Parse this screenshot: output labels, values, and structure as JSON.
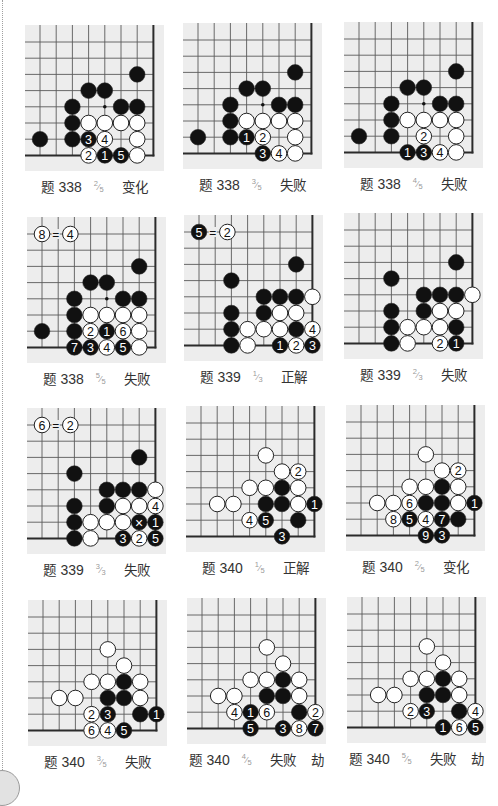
{
  "style": {
    "board_bg": "#ededed",
    "grid_line": "#5a5a5a",
    "edge_line": "#2b2b2b",
    "black_stone": "#111111",
    "white_stone": "#ffffff",
    "stone_outline": "#222222",
    "caption_text": "#333333",
    "fraction_text": "#9a9a9a"
  },
  "fraction_slash": "⁄",
  "diagrams": [
    {
      "problem_label": "题",
      "problem_number": "338",
      "fraction": {
        "num": "2",
        "den": "5"
      },
      "result": "变化",
      "extra": "",
      "star_points": [
        [
          4,
          4
        ]
      ],
      "note": null,
      "stones": [
        [
          "b",
          6,
          2
        ],
        [
          "b",
          3,
          3
        ],
        [
          "b",
          4,
          3
        ],
        [
          "b",
          2,
          4
        ],
        [
          "b",
          5,
          4
        ],
        [
          "b",
          6,
          4
        ],
        [
          "b",
          2,
          5
        ],
        [
          "w",
          3,
          5
        ],
        [
          "w",
          4,
          5
        ],
        [
          "w",
          5,
          5
        ],
        [
          "w",
          6,
          5
        ],
        [
          "b",
          0,
          6
        ],
        [
          "b",
          2,
          6
        ],
        [
          "b",
          3,
          6,
          "3"
        ],
        [
          "w",
          4,
          6,
          "4"
        ],
        [
          "w",
          6,
          6
        ],
        [
          "w",
          3,
          7,
          "2"
        ],
        [
          "b",
          4,
          7,
          "1"
        ],
        [
          "b",
          5,
          7,
          "5"
        ],
        [
          "w",
          6,
          7
        ]
      ]
    },
    {
      "problem_label": "题",
      "problem_number": "338",
      "fraction": {
        "num": "3",
        "den": "5"
      },
      "result": "失败",
      "extra": "",
      "star_points": [
        [
          4,
          4
        ]
      ],
      "note": null,
      "stones": [
        [
          "b",
          6,
          2
        ],
        [
          "b",
          3,
          3
        ],
        [
          "b",
          4,
          3
        ],
        [
          "b",
          2,
          4
        ],
        [
          "b",
          5,
          4
        ],
        [
          "b",
          6,
          4
        ],
        [
          "b",
          2,
          5
        ],
        [
          "w",
          3,
          5
        ],
        [
          "w",
          4,
          5
        ],
        [
          "w",
          5,
          5
        ],
        [
          "w",
          6,
          5
        ],
        [
          "b",
          0,
          6
        ],
        [
          "b",
          2,
          6
        ],
        [
          "b",
          3,
          6,
          "1"
        ],
        [
          "w",
          4,
          6,
          "2"
        ],
        [
          "w",
          6,
          6
        ],
        [
          "b",
          4,
          7,
          "3"
        ],
        [
          "w",
          5,
          7,
          "4"
        ],
        [
          "w",
          6,
          7
        ]
      ]
    },
    {
      "problem_label": "题",
      "problem_number": "338",
      "fraction": {
        "num": "4",
        "den": "5"
      },
      "result": "失败",
      "extra": "",
      "star_points": [
        [
          4,
          4
        ]
      ],
      "note": null,
      "stones": [
        [
          "b",
          6,
          2
        ],
        [
          "b",
          3,
          3
        ],
        [
          "b",
          4,
          3
        ],
        [
          "b",
          2,
          4
        ],
        [
          "b",
          5,
          4
        ],
        [
          "b",
          6,
          4
        ],
        [
          "b",
          2,
          5
        ],
        [
          "w",
          3,
          5
        ],
        [
          "w",
          4,
          5
        ],
        [
          "w",
          5,
          5
        ],
        [
          "w",
          6,
          5
        ],
        [
          "b",
          0,
          6
        ],
        [
          "b",
          2,
          6
        ],
        [
          "w",
          4,
          6,
          "2"
        ],
        [
          "w",
          6,
          6
        ],
        [
          "b",
          3,
          7,
          "1"
        ],
        [
          "b",
          4,
          7,
          "3"
        ],
        [
          "w",
          5,
          7,
          "4"
        ],
        [
          "w",
          6,
          7
        ]
      ]
    },
    {
      "problem_label": "题",
      "problem_number": "338",
      "fraction": {
        "num": "5",
        "den": "5"
      },
      "result": "失败",
      "extra": "",
      "star_points": [
        [
          4,
          4
        ]
      ],
      "note": {
        "row": 0,
        "left": {
          "color": "w",
          "label": "8",
          "col": 0
        },
        "equals": "=",
        "equals_col": 0.85,
        "right": {
          "color": "w",
          "label": "4",
          "col": 1.75
        }
      },
      "stones": [
        [
          "b",
          6,
          2
        ],
        [
          "b",
          3,
          3
        ],
        [
          "b",
          4,
          3
        ],
        [
          "b",
          2,
          4
        ],
        [
          "b",
          5,
          4
        ],
        [
          "b",
          6,
          4
        ],
        [
          "b",
          2,
          5
        ],
        [
          "w",
          3,
          5
        ],
        [
          "w",
          4,
          5
        ],
        [
          "w",
          5,
          5
        ],
        [
          "w",
          6,
          5
        ],
        [
          "b",
          0,
          6
        ],
        [
          "b",
          2,
          6
        ],
        [
          "w",
          3,
          6,
          "2"
        ],
        [
          "b",
          4,
          6,
          "1"
        ],
        [
          "w",
          5,
          6,
          "6"
        ],
        [
          "w",
          6,
          6
        ],
        [
          "b",
          2,
          7,
          "7"
        ],
        [
          "b",
          3,
          7,
          "3"
        ],
        [
          "w",
          4,
          7,
          "4"
        ],
        [
          "b",
          5,
          7,
          "5"
        ],
        [
          "w",
          6,
          7
        ]
      ]
    },
    {
      "problem_label": "题",
      "problem_number": "339",
      "fraction": {
        "num": "1",
        "den": "3"
      },
      "result": "正解",
      "extra": "",
      "star_points": [],
      "note": {
        "row": 0,
        "left": {
          "color": "b",
          "label": "5",
          "col": 0
        },
        "equals": "=",
        "equals_col": 0.85,
        "right": {
          "color": "w",
          "label": "2",
          "col": 1.75
        }
      },
      "stones": [
        [
          "b",
          6,
          2
        ],
        [
          "b",
          2,
          3
        ],
        [
          "b",
          4,
          4
        ],
        [
          "b",
          5,
          4
        ],
        [
          "b",
          6,
          4
        ],
        [
          "w",
          7,
          4
        ],
        [
          "b",
          2,
          5
        ],
        [
          "b",
          4,
          5
        ],
        [
          "w",
          5,
          5
        ],
        [
          "w",
          6,
          5
        ],
        [
          "b",
          2,
          6
        ],
        [
          "w",
          3,
          6
        ],
        [
          "w",
          4,
          6
        ],
        [
          "w",
          5,
          6
        ],
        [
          "b",
          6,
          6
        ],
        [
          "w",
          7,
          6,
          "4"
        ],
        [
          "b",
          2,
          7
        ],
        [
          "w",
          3,
          7
        ],
        [
          "b",
          5,
          7,
          "1"
        ],
        [
          "w",
          6,
          7,
          "2"
        ],
        [
          "b",
          7,
          7,
          "3"
        ]
      ]
    },
    {
      "problem_label": "题",
      "problem_number": "339",
      "fraction": {
        "num": "2",
        "den": "3"
      },
      "result": "失败",
      "extra": "",
      "star_points": [],
      "note": null,
      "stones": [
        [
          "b",
          6,
          2
        ],
        [
          "b",
          2,
          3
        ],
        [
          "b",
          4,
          4
        ],
        [
          "b",
          5,
          4
        ],
        [
          "b",
          6,
          4
        ],
        [
          "w",
          7,
          4
        ],
        [
          "b",
          2,
          5
        ],
        [
          "b",
          4,
          5
        ],
        [
          "w",
          5,
          5
        ],
        [
          "w",
          6,
          5
        ],
        [
          "b",
          2,
          6
        ],
        [
          "w",
          3,
          6
        ],
        [
          "w",
          4,
          6
        ],
        [
          "w",
          5,
          6
        ],
        [
          "b",
          6,
          6
        ],
        [
          "b",
          2,
          7
        ],
        [
          "w",
          3,
          7
        ],
        [
          "w",
          5,
          7,
          "2"
        ],
        [
          "b",
          6,
          7,
          "1"
        ]
      ]
    },
    {
      "problem_label": "题",
      "problem_number": "339",
      "fraction": {
        "num": "3",
        "den": "3"
      },
      "result": "失败",
      "extra": "",
      "star_points": [],
      "note": {
        "row": 0,
        "left": {
          "color": "w",
          "label": "6",
          "col": 0
        },
        "equals": "=",
        "equals_col": 0.85,
        "right": {
          "color": "w",
          "label": "2",
          "col": 1.75
        }
      },
      "stones": [
        [
          "b",
          6,
          2
        ],
        [
          "b",
          2,
          3
        ],
        [
          "b",
          4,
          4
        ],
        [
          "b",
          5,
          4
        ],
        [
          "b",
          6,
          4
        ],
        [
          "w",
          7,
          4
        ],
        [
          "b",
          2,
          5
        ],
        [
          "b",
          4,
          5
        ],
        [
          "w",
          5,
          5
        ],
        [
          "w",
          6,
          5
        ],
        [
          "w",
          7,
          5,
          "4"
        ],
        [
          "b",
          2,
          6
        ],
        [
          "w",
          3,
          6
        ],
        [
          "w",
          4,
          6
        ],
        [
          "w",
          5,
          6
        ],
        [
          "b",
          6,
          6,
          "×"
        ],
        [
          "b",
          7,
          6,
          "1"
        ],
        [
          "b",
          2,
          7
        ],
        [
          "w",
          3,
          7
        ],
        [
          "b",
          5,
          7,
          "3"
        ],
        [
          "w",
          6,
          7,
          "2"
        ],
        [
          "b",
          7,
          7,
          "5"
        ]
      ]
    },
    {
      "problem_label": "题",
      "problem_number": "340",
      "fraction": {
        "num": "1",
        "den": "5"
      },
      "result": "正解",
      "extra": "",
      "star_points": [],
      "note": null,
      "stones": [
        [
          "w",
          4,
          2
        ],
        [
          "w",
          5,
          3
        ],
        [
          "w",
          6,
          3,
          "2"
        ],
        [
          "w",
          3,
          4
        ],
        [
          "w",
          4,
          4
        ],
        [
          "b",
          5,
          4
        ],
        [
          "w",
          6,
          4
        ],
        [
          "w",
          1,
          5
        ],
        [
          "w",
          2,
          5
        ],
        [
          "b",
          4,
          5
        ],
        [
          "b",
          5,
          5
        ],
        [
          "w",
          6,
          5
        ],
        [
          "b",
          7,
          5,
          "1"
        ],
        [
          "w",
          3,
          6,
          "4"
        ],
        [
          "b",
          4,
          6,
          "5"
        ],
        [
          "b",
          6,
          6
        ],
        [
          "b",
          5,
          7,
          "3"
        ]
      ]
    },
    {
      "problem_label": "题",
      "problem_number": "340",
      "fraction": {
        "num": "2",
        "den": "5"
      },
      "result": "变化",
      "extra": "",
      "star_points": [],
      "note": null,
      "stones": [
        [
          "w",
          4,
          2
        ],
        [
          "w",
          5,
          3
        ],
        [
          "w",
          6,
          3,
          "2"
        ],
        [
          "w",
          3,
          4
        ],
        [
          "w",
          4,
          4
        ],
        [
          "b",
          5,
          4
        ],
        [
          "w",
          6,
          4
        ],
        [
          "w",
          1,
          5
        ],
        [
          "w",
          2,
          5
        ],
        [
          "w",
          3,
          5,
          "6"
        ],
        [
          "b",
          4,
          5
        ],
        [
          "b",
          5,
          5
        ],
        [
          "w",
          6,
          5
        ],
        [
          "b",
          7,
          5,
          "1"
        ],
        [
          "w",
          2,
          6,
          "8"
        ],
        [
          "b",
          3,
          6,
          "5"
        ],
        [
          "w",
          4,
          6,
          "4"
        ],
        [
          "b",
          5,
          6,
          "7"
        ],
        [
          "b",
          6,
          6
        ],
        [
          "b",
          4,
          7,
          "9"
        ],
        [
          "b",
          5,
          7,
          "3"
        ]
      ]
    },
    {
      "problem_label": "题",
      "problem_number": "340",
      "fraction": {
        "num": "3",
        "den": "5"
      },
      "result": "失败",
      "extra": "",
      "star_points": [],
      "note": null,
      "stones": [
        [
          "w",
          4,
          2
        ],
        [
          "w",
          5,
          3
        ],
        [
          "w",
          3,
          4
        ],
        [
          "w",
          4,
          4
        ],
        [
          "b",
          5,
          4
        ],
        [
          "w",
          6,
          4
        ],
        [
          "w",
          1,
          5
        ],
        [
          "w",
          2,
          5
        ],
        [
          "b",
          4,
          5
        ],
        [
          "b",
          5,
          5
        ],
        [
          "w",
          6,
          5
        ],
        [
          "w",
          3,
          6,
          "2"
        ],
        [
          "b",
          4,
          6,
          "3"
        ],
        [
          "b",
          6,
          6
        ],
        [
          "b",
          7,
          6,
          "1"
        ],
        [
          "w",
          3,
          7,
          "6"
        ],
        [
          "w",
          4,
          7,
          "4"
        ],
        [
          "b",
          5,
          7,
          "5"
        ]
      ]
    },
    {
      "problem_label": "题",
      "problem_number": "340",
      "fraction": {
        "num": "4",
        "den": "5"
      },
      "result": "失败",
      "extra": "劫",
      "star_points": [],
      "note": null,
      "stones": [
        [
          "w",
          4,
          2
        ],
        [
          "w",
          5,
          3
        ],
        [
          "w",
          3,
          4
        ],
        [
          "w",
          4,
          4
        ],
        [
          "b",
          5,
          4
        ],
        [
          "w",
          6,
          4
        ],
        [
          "w",
          1,
          5
        ],
        [
          "w",
          2,
          5
        ],
        [
          "b",
          4,
          5
        ],
        [
          "b",
          5,
          5
        ],
        [
          "w",
          6,
          5
        ],
        [
          "w",
          2,
          6,
          "4"
        ],
        [
          "b",
          3,
          6,
          "1"
        ],
        [
          "w",
          4,
          6,
          "6"
        ],
        [
          "b",
          6,
          6
        ],
        [
          "w",
          7,
          6,
          "2"
        ],
        [
          "b",
          3,
          7,
          "5"
        ],
        [
          "b",
          5,
          7,
          "3"
        ],
        [
          "w",
          6,
          7,
          "8"
        ],
        [
          "b",
          7,
          7,
          "7"
        ]
      ]
    },
    {
      "problem_label": "题",
      "problem_number": "340",
      "fraction": {
        "num": "5",
        "den": "5"
      },
      "result": "失败",
      "extra": "劫",
      "star_points": [],
      "note": null,
      "stones": [
        [
          "w",
          4,
          2
        ],
        [
          "w",
          5,
          3
        ],
        [
          "w",
          3,
          4
        ],
        [
          "w",
          4,
          4
        ],
        [
          "b",
          5,
          4
        ],
        [
          "w",
          6,
          4
        ],
        [
          "w",
          1,
          5
        ],
        [
          "w",
          2,
          5
        ],
        [
          "b",
          4,
          5
        ],
        [
          "b",
          5,
          5
        ],
        [
          "w",
          6,
          5
        ],
        [
          "w",
          3,
          6,
          "2"
        ],
        [
          "b",
          4,
          6,
          "3"
        ],
        [
          "b",
          6,
          6
        ],
        [
          "w",
          7,
          6,
          "4"
        ],
        [
          "b",
          5,
          7,
          "1"
        ],
        [
          "w",
          6,
          7,
          "6"
        ],
        [
          "b",
          7,
          7,
          "5"
        ]
      ]
    }
  ]
}
